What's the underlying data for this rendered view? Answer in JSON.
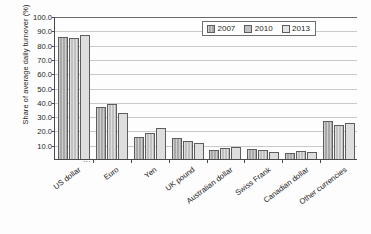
{
  "chart_data": {
    "type": "bar",
    "title": "",
    "xlabel": "",
    "ylabel": "Share of average daily turnover (%)",
    "ylim": [
      0,
      100
    ],
    "yticks": [
      "100.0",
      "90.0",
      "80.0",
      "70.0",
      "60.0",
      "50.0",
      "40.0",
      "30.0",
      "20.0",
      "10.0"
    ],
    "ytick_values": [
      100,
      90,
      80,
      70,
      60,
      50,
      40,
      30,
      20,
      10
    ],
    "axis_break_symbol": "...",
    "grid": true,
    "legend_position": "top-right",
    "categories": [
      "US dollar",
      "Euro",
      "Yen",
      "UK pound",
      "Australian dollar",
      "Swiss Frank",
      "Canadian dollar",
      "Other currencies"
    ],
    "series": [
      {
        "name": "2007",
        "color": "#a8a8a8",
        "values": [
          85.0,
          36.5,
          15.5,
          14.5,
          6.5,
          6.8,
          4.2,
          26.5
        ]
      },
      {
        "name": "2010",
        "color": "#c0c0c0",
        "values": [
          84.9,
          38.5,
          18.0,
          12.5,
          7.5,
          6.3,
          5.3,
          24.0
        ]
      },
      {
        "name": "2013",
        "color": "#dedede",
        "values": [
          87.0,
          32.5,
          22.0,
          11.0,
          8.5,
          5.2,
          4.6,
          25.3
        ]
      }
    ]
  },
  "legend": {
    "entries": [
      {
        "label": "2007"
      },
      {
        "label": "2010"
      },
      {
        "label": "2013"
      }
    ]
  }
}
